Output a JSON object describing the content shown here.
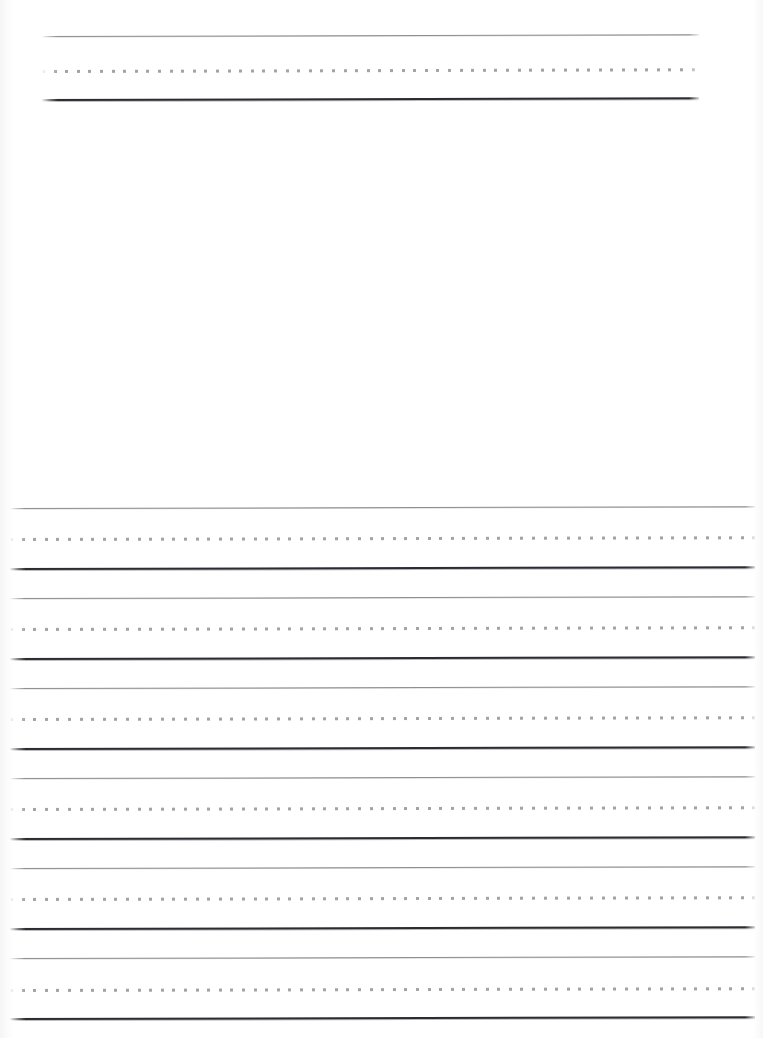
{
  "page": {
    "kind": "handwriting-practice-worksheet",
    "width": 763,
    "height": 1038,
    "background_color": "#ffffff",
    "scanned": true,
    "title_text": "",
    "instructions_text": "",
    "page_number_text": ""
  },
  "colors": {
    "paper": "#ffffff",
    "top_rule": "#8e8e92",
    "dotted_midline": "#9b9ba0",
    "baseline": "#2b2b30"
  },
  "rule_style": {
    "top_rule_label": "top line",
    "midline_label": "dotted midline",
    "baseline_label": "baseline",
    "top_rule_thickness_px": 1,
    "midline_thickness_px": 3,
    "baseline_thickness_px": 2,
    "dash_length_px": 3,
    "dash_gap_px": 8.6,
    "line_spacing_px": 30
  },
  "sections": {
    "heading_section": {
      "name": "title-writing-line",
      "left_px": 42,
      "right_px": 699,
      "width_px": 657,
      "groups": [
        {
          "label": "heading line 1",
          "top_y": 36,
          "mid_y": 70,
          "base_y": 99
        }
      ]
    },
    "drawing_section": {
      "name": "drawing-area",
      "left_px": 0,
      "top_px": 110,
      "width_px": 763,
      "height_px": 392,
      "caption": ""
    },
    "body_section": {
      "name": "body-writing-lines",
      "left_px": 10,
      "right_px": 755,
      "width_px": 745,
      "groups": [
        {
          "label": "body line 1",
          "top_y": 508,
          "mid_y": 538,
          "base_y": 568
        },
        {
          "label": "body line 2",
          "top_y": 598,
          "mid_y": 628,
          "base_y": 658
        },
        {
          "label": "body line 3",
          "top_y": 688,
          "mid_y": 718,
          "base_y": 748
        },
        {
          "label": "body line 4",
          "top_y": 778,
          "mid_y": 808,
          "base_y": 838
        },
        {
          "label": "body line 5",
          "top_y": 868,
          "mid_y": 898,
          "base_y": 928
        },
        {
          "label": "body line 6",
          "top_y": 958,
          "mid_y": 989,
          "base_y": 1018
        }
      ]
    }
  }
}
